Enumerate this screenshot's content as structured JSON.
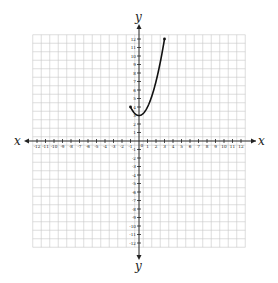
{
  "chart_data": {
    "type": "line",
    "title": "",
    "xlabel": "x",
    "ylabel": "y",
    "xlim": [
      -12.5,
      12.5
    ],
    "ylim": [
      -12.5,
      12.5
    ],
    "grid": true,
    "x_ticks": [
      -12,
      -11,
      -10,
      -9,
      -8,
      -7,
      -6,
      -5,
      -4,
      -3,
      -2,
      -1,
      1,
      2,
      3,
      4,
      5,
      6,
      7,
      8,
      9,
      10,
      11,
      12
    ],
    "y_ticks": [
      -12,
      -11,
      -10,
      -9,
      -8,
      -7,
      -6,
      -5,
      -4,
      -3,
      -2,
      -1,
      1,
      2,
      3,
      4,
      5,
      6,
      7,
      8,
      9,
      10,
      11,
      12
    ],
    "origin_label": "0",
    "series": [
      {
        "name": "y = x^2 + 3",
        "domain": [
          -1,
          3
        ],
        "points": [
          [
            -1,
            4
          ],
          [
            -0.5,
            3.25
          ],
          [
            0,
            3
          ],
          [
            0.5,
            3.25
          ],
          [
            1,
            4
          ],
          [
            1.5,
            5.25
          ],
          [
            2,
            7
          ],
          [
            2.5,
            9.25
          ],
          [
            3,
            12
          ]
        ],
        "endpoints": [
          [
            -1,
            4
          ],
          [
            3,
            12
          ]
        ],
        "color": "#111111"
      }
    ]
  },
  "colors": {
    "grid": "#c8c8c8",
    "axis": "#222222",
    "curve": "#111111"
  }
}
